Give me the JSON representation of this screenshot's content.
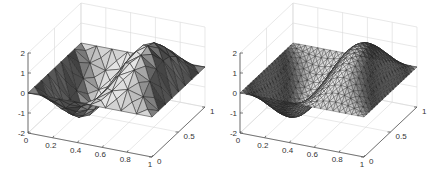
{
  "chart_data": [
    {
      "type": "surface",
      "title": "",
      "mesh": "coarse triangular",
      "grid_n": 8,
      "xlabel": "",
      "ylabel": "",
      "zlabel": "",
      "x_ticks": [
        "0",
        "0.2",
        "0.4",
        "0.6",
        "0.8",
        "1"
      ],
      "y_ticks": [
        "0",
        "0.5",
        "1"
      ],
      "z_ticks": [
        "-2",
        "-1",
        "0",
        "1",
        "2"
      ],
      "xlim": [
        0,
        1
      ],
      "ylim": [
        0,
        1
      ],
      "zlim": [
        -2,
        2
      ],
      "function_estimate": "z = 2*sin(2*pi*x)*sin(pi*y)",
      "colormap": "gray",
      "grid": true
    },
    {
      "type": "surface",
      "title": "",
      "mesh": "fine triangular",
      "grid_n": 20,
      "xlabel": "",
      "ylabel": "",
      "zlabel": "",
      "x_ticks": [
        "0",
        "0.2",
        "0.4",
        "0.6",
        "0.8",
        "1"
      ],
      "y_ticks": [
        "0",
        "0.5",
        "1"
      ],
      "z_ticks": [
        "-2",
        "-1",
        "0",
        "1",
        "2"
      ],
      "xlim": [
        0,
        1
      ],
      "ylim": [
        0,
        1
      ],
      "zlim": [
        -2,
        2
      ],
      "function_estimate": "z = 2*sin(2*pi*x)*sin(pi*y)",
      "colormap": "gray",
      "grid": true
    }
  ],
  "panels": [
    {
      "origin_x": 28
    },
    {
      "origin_x": 240
    }
  ]
}
